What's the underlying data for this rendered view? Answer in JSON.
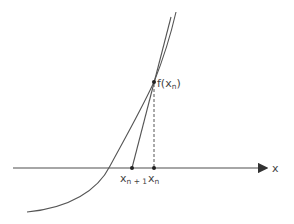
{
  "diagram": {
    "labels": {
      "function_point": "f(x",
      "function_point_sub": "n",
      "function_point_close": ")",
      "x_n": "x",
      "x_n_sub": "n",
      "x_n1": "x",
      "x_n1_sub": "n + 1",
      "axis": "x"
    },
    "colors": {
      "curve": "#555555",
      "axis": "#777777",
      "text": "#444444"
    }
  }
}
